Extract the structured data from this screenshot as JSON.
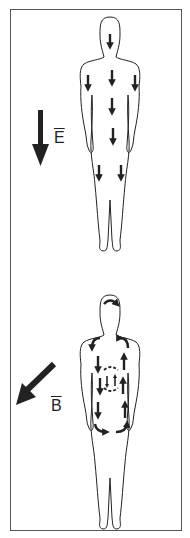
{
  "panels": [
    {
      "id": "electric-field",
      "field_label": "E",
      "field_direction": "down",
      "description": "Uniform electric field; induced currents flow downward through body"
    },
    {
      "id": "magnetic-field",
      "field_label": "B",
      "field_direction": "down-left",
      "description": "Magnetic field; induced eddy currents circulate in loops within the body"
    }
  ],
  "colors": {
    "line": "#222222",
    "frame": "#555555",
    "background": "#ffffff"
  }
}
